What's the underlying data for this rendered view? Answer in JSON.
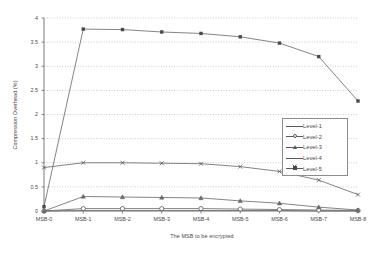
{
  "chart_data": {
    "type": "line",
    "title": "",
    "xlabel": "The MSB to be encrypted",
    "ylabel": "Compression Overhead (%)",
    "categories": [
      "MSB-0",
      "MSB-1",
      "MSB-2",
      "MSB-3",
      "MSB-4",
      "MSB-5",
      "MSB-6",
      "MSB-7",
      "MSB-8"
    ],
    "ylim": [
      0,
      4
    ],
    "yticks": [
      "0",
      "0.5",
      "1",
      "1.5",
      "2",
      "2.5",
      "3",
      "3.5",
      "4"
    ],
    "ytick_values": [
      0,
      0.5,
      1,
      1.5,
      2,
      2.5,
      3,
      3.5,
      4
    ],
    "grid": true,
    "legend_position": "center right",
    "series": [
      {
        "name": "Level-1",
        "marker": "plain",
        "values": [
          0.0,
          0.01,
          0.01,
          0.01,
          0.01,
          0.01,
          0.01,
          0.0,
          0.0
        ]
      },
      {
        "name": "Level-2",
        "marker": "circle",
        "values": [
          0.0,
          0.05,
          0.05,
          0.05,
          0.05,
          0.04,
          0.03,
          0.02,
          0.01
        ]
      },
      {
        "name": "Level-3",
        "marker": "triangle",
        "values": [
          0.0,
          0.3,
          0.29,
          0.28,
          0.27,
          0.21,
          0.16,
          0.08,
          0.02
        ]
      },
      {
        "name": "Level-4",
        "marker": "x",
        "values": [
          0.9,
          1.0,
          1.0,
          0.99,
          0.98,
          0.92,
          0.82,
          0.64,
          0.34
        ]
      },
      {
        "name": "Level-5",
        "marker": "square",
        "values": [
          0.09,
          3.77,
          3.76,
          3.71,
          3.68,
          3.61,
          3.48,
          3.2,
          2.28
        ]
      }
    ]
  }
}
